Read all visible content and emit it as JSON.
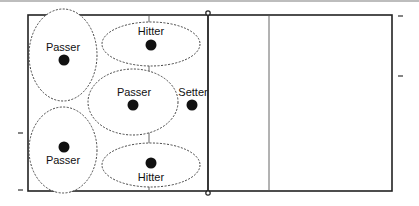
{
  "diagram": {
    "title": "",
    "colors": {
      "court_line": "#222222",
      "attack_line": "#555555",
      "zone_outline": "#444444",
      "player_dot": "#111111",
      "top_rule": "#bdbdbd"
    },
    "players": [
      {
        "id": "passer-left-front",
        "role": "Passer",
        "label_position": "above"
      },
      {
        "id": "hitter-top",
        "role": "Hitter",
        "label_position": "above"
      },
      {
        "id": "passer-middle",
        "role": "Passer",
        "label_position": "above"
      },
      {
        "id": "setter",
        "role": "Setter",
        "label_position": "above"
      },
      {
        "id": "passer-left-back",
        "role": "Passer",
        "label_position": "below"
      },
      {
        "id": "hitter-bottom",
        "role": "Hitter",
        "label_position": "below"
      }
    ]
  }
}
